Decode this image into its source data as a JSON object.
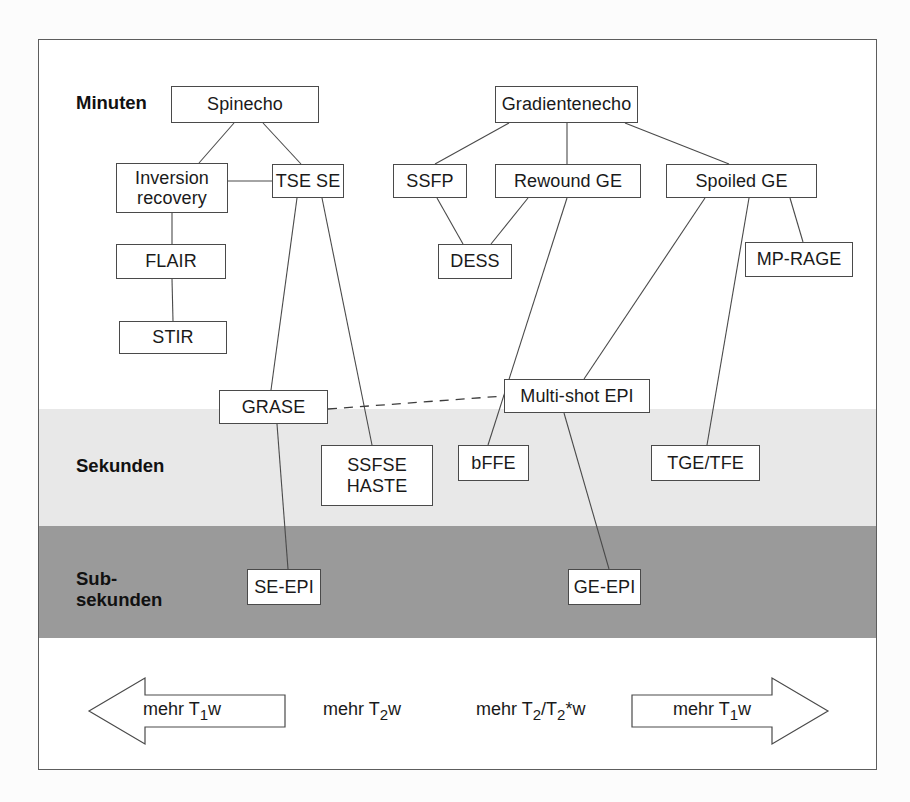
{
  "diagram": {
    "scale_labels": [
      {
        "id": "minuten",
        "text": "Minuten",
        "x": 37,
        "y": 52
      },
      {
        "id": "sekunden",
        "text": "Sekunden",
        "x": 37,
        "y": 415
      },
      {
        "id": "subsekunden",
        "text": "Sub-\nsekunden",
        "x": 37,
        "y": 528
      }
    ],
    "bands": [
      {
        "id": "sekunden-band",
        "color": "#e8e8e8"
      },
      {
        "id": "subsekunden-band",
        "color": "#9a9a9a"
      }
    ],
    "nodes": [
      {
        "id": "spinecho",
        "label": "Spinecho",
        "x": 132,
        "y": 46,
        "w": 148,
        "h": 37
      },
      {
        "id": "gradientenecho",
        "label": "Gradientenecho",
        "x": 456,
        "y": 46,
        "w": 143,
        "h": 37
      },
      {
        "id": "inversion-recovery",
        "label": "Inversion\nrecovery",
        "x": 77,
        "y": 123,
        "w": 112,
        "h": 50
      },
      {
        "id": "tse-se",
        "label": "TSE SE",
        "x": 233,
        "y": 124,
        "w": 72,
        "h": 34
      },
      {
        "id": "ssfp",
        "label": "SSFP",
        "x": 354,
        "y": 124,
        "w": 74,
        "h": 34
      },
      {
        "id": "rewound-ge",
        "label": "Rewound GE",
        "x": 456,
        "y": 124,
        "w": 146,
        "h": 34
      },
      {
        "id": "spoiled-ge",
        "label": "Spoiled GE",
        "x": 627,
        "y": 124,
        "w": 151,
        "h": 34
      },
      {
        "id": "flair",
        "label": "FLAIR",
        "x": 77,
        "y": 204,
        "w": 110,
        "h": 35
      },
      {
        "id": "dess",
        "label": "DESS",
        "x": 399,
        "y": 204,
        "w": 74,
        "h": 35
      },
      {
        "id": "mp-rage",
        "label": "MP-RAGE",
        "x": 706,
        "y": 202,
        "w": 108,
        "h": 35
      },
      {
        "id": "stir",
        "label": "STIR",
        "x": 80,
        "y": 281,
        "w": 108,
        "h": 33
      },
      {
        "id": "multi-shot-epi",
        "label": "Multi-shot EPI",
        "x": 465,
        "y": 339,
        "w": 146,
        "h": 34
      },
      {
        "id": "grase",
        "label": "GRASE",
        "x": 180,
        "y": 350,
        "w": 109,
        "h": 34
      },
      {
        "id": "ssfse-haste",
        "label": "SSFSE\nHASTE",
        "x": 282,
        "y": 405,
        "w": 112,
        "h": 61
      },
      {
        "id": "bffe",
        "label": "bFFE",
        "x": 419,
        "y": 405,
        "w": 71,
        "h": 36
      },
      {
        "id": "tge-tfe",
        "label": "TGE/TFE",
        "x": 612,
        "y": 405,
        "w": 109,
        "h": 36
      },
      {
        "id": "se-epi",
        "label": "SE-EPI",
        "x": 208,
        "y": 529,
        "w": 74,
        "h": 36
      },
      {
        "id": "ge-epi",
        "label": "GE-EPI",
        "x": 529,
        "y": 529,
        "w": 73,
        "h": 36
      }
    ],
    "edges": [
      {
        "from": "spinecho",
        "to": "inversion-recovery",
        "style": "solid"
      },
      {
        "from": "spinecho",
        "to": "tse-se",
        "style": "solid"
      },
      {
        "from": "inversion-recovery",
        "to": "tse-se",
        "style": "solid"
      },
      {
        "from": "inversion-recovery",
        "to": "flair",
        "style": "solid"
      },
      {
        "from": "flair",
        "to": "stir",
        "style": "solid"
      },
      {
        "from": "tse-se",
        "to": "grase",
        "style": "solid"
      },
      {
        "from": "tse-se",
        "to": "ssfse-haste",
        "style": "solid"
      },
      {
        "from": "gradientenecho",
        "to": "ssfp",
        "style": "solid"
      },
      {
        "from": "gradientenecho",
        "to": "rewound-ge",
        "style": "solid"
      },
      {
        "from": "gradientenecho",
        "to": "spoiled-ge",
        "style": "solid"
      },
      {
        "from": "ssfp",
        "to": "dess",
        "style": "solid"
      },
      {
        "from": "rewound-ge",
        "to": "dess",
        "style": "solid"
      },
      {
        "from": "rewound-ge",
        "to": "bffe",
        "style": "solid"
      },
      {
        "from": "spoiled-ge",
        "to": "multi-shot-epi",
        "style": "solid"
      },
      {
        "from": "spoiled-ge",
        "to": "tge-tfe",
        "style": "solid"
      },
      {
        "from": "spoiled-ge",
        "to": "mp-rage",
        "style": "solid"
      },
      {
        "from": "grase",
        "to": "se-epi",
        "style": "solid"
      },
      {
        "from": "multi-shot-epi",
        "to": "ge-epi",
        "style": "solid"
      },
      {
        "from": "grase",
        "to": "multi-shot-epi",
        "style": "dashed"
      }
    ],
    "weighting_axis": {
      "left_arrow_label": "mehr T1w",
      "left_arrow_direction": "left",
      "right_arrow_label": "mehr T1w",
      "right_arrow_direction": "right",
      "middle_labels": [
        "mehr T2w",
        "mehr T2/T2*w"
      ]
    }
  }
}
